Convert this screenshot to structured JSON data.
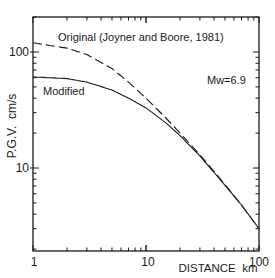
{
  "chart_data": {
    "type": "line",
    "title": "",
    "xlabel": "DISTANCE  km",
    "ylabel": "P.G.V.  cm/s",
    "xscale": "log",
    "yscale": "log",
    "xlim": [
      1,
      100
    ],
    "ylim": [
      1.9,
      190
    ],
    "x_tick_labels": [
      "1",
      "10",
      "100"
    ],
    "y_tick_labels": [
      "10",
      "100"
    ],
    "grid": false,
    "annotations": [
      {
        "text": "Original (Joyner and Boore, 1981)",
        "x": 1.6,
        "y": 135
      },
      {
        "text": "Modified",
        "x": 1.15,
        "y": 45
      },
      {
        "text": "Mw=6.9",
        "x": 50,
        "y": 56
      }
    ],
    "x": [
      1,
      2,
      3,
      5,
      7,
      10,
      15,
      20,
      30,
      50,
      70,
      100
    ],
    "series": [
      {
        "name": "Original (Joyner and Boore, 1981)",
        "style": "dashed",
        "values": [
          120,
          108,
          95,
          72,
          55,
          40,
          27,
          20,
          13,
          7.2,
          4.8,
          3.0
        ]
      },
      {
        "name": "Modified",
        "style": "solid",
        "values": [
          61,
          59,
          55,
          47,
          40,
          33,
          24.5,
          19,
          12.7,
          7.1,
          4.8,
          3.0
        ]
      }
    ]
  }
}
